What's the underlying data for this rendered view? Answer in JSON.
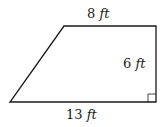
{
  "diagram": {
    "shape": "right trapezoid",
    "stroke_color": "#1a1a1a",
    "background": "#ffffff",
    "vertices": {
      "bottom_left": [
        10,
        102
      ],
      "bottom_right": [
        156,
        102
      ],
      "top_right": [
        156,
        26
      ],
      "top_left": [
        64,
        26
      ]
    },
    "right_angle_marker": {
      "corner": "bottom_right",
      "size": 8
    },
    "labels": {
      "top": {
        "value": "8",
        "unit": "ft"
      },
      "right": {
        "value": "6",
        "unit": "ft"
      },
      "bottom": {
        "value": "13",
        "unit": "ft"
      }
    }
  }
}
